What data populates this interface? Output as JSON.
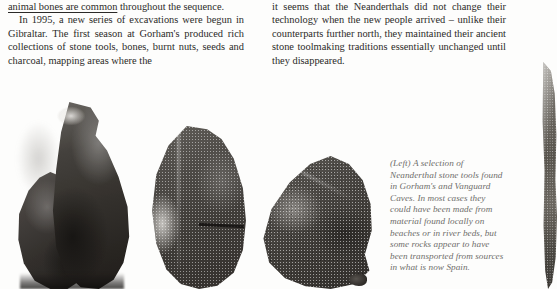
{
  "page": {
    "background_color": "#fdfdfc",
    "text_color": "#2b2a28",
    "caption_color": "#6f6d6b"
  },
  "columns": {
    "left": {
      "continued_line": {
        "underlined_text": "animal bones are common",
        "rest_text": " throughout the sequence."
      },
      "paragraph": "In 1995, a new series of excavations were begun in Gibraltar. The first season at Gorham's produced rich collections of stone tools, bones, burnt nuts, seeds and charcoal, mapping areas where the"
    },
    "right": {
      "paragraph": "it seems that the Neanderthals did not change their technology when the new people arrived – unlike their counterparts further north, they maintained their ancient stone toolmaking traditions essentially unchanged until they disappeared."
    }
  },
  "caption": {
    "full_text": "(Left) A selection of Neanderthal stone tools found in Gorham's and Vanguard Caves. In most cases they could have been made from material found locally on beaches or in river beds, but some rocks appear to have been transported from sources in what is now Spain.",
    "lines": [
      "(Left) A selection of",
      "Neanderthal stone tools found",
      "in Gorham's and Vanguard",
      "Caves. In most cases they",
      "could have been made from",
      "material found locally on",
      "beaches or in river beds, but",
      "some rocks appear to have",
      "been transported from sources",
      "in what is now Spain."
    ]
  },
  "figures": [
    {
      "id": "stone-1",
      "label": "neanderthal-stone-tool-photo-1",
      "description": "Large dark two-lobed flaked stone tool"
    },
    {
      "id": "stone-2",
      "label": "neanderthal-stone-tool-photo-2",
      "description": "Coarse grainy speckled stone block"
    },
    {
      "id": "stone-3",
      "label": "neanderthal-stone-tool-photo-3",
      "description": "Triangular grainy flaked stone tool"
    },
    {
      "id": "stone-4",
      "label": "neanderthal-stone-tool-photo-4",
      "description": "Narrow stone tool cropped at right page edge"
    }
  ]
}
